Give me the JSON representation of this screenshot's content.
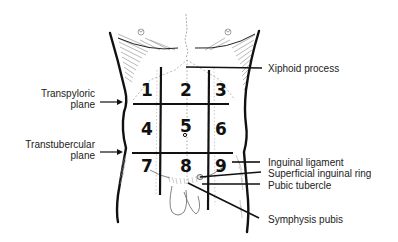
{
  "figure": {
    "regions": [
      "1",
      "2",
      "3",
      "4",
      "5",
      "6",
      "7",
      "8",
      "9"
    ],
    "left_labels": [
      {
        "id": "transpyloric",
        "line1": "Transpyloric",
        "line2": "plane"
      },
      {
        "id": "transtubercular",
        "line1": "Transtubercular",
        "line2": "plane"
      }
    ],
    "right_labels": [
      {
        "id": "xiphoid",
        "text": "Xiphoid process"
      },
      {
        "id": "inguinal-ligament",
        "text": "Inguinal ligament"
      },
      {
        "id": "superficial-inguinal-ring",
        "text": "Superficial inguinal ring"
      },
      {
        "id": "pubic-tubercle",
        "text": "Pubic tubercle"
      },
      {
        "id": "symphysis-pubis",
        "text": "Symphysis pubis"
      }
    ],
    "colors": {
      "line": "#111111",
      "hatch": "#777777",
      "text": "#222222",
      "background": "#ffffff"
    }
  }
}
